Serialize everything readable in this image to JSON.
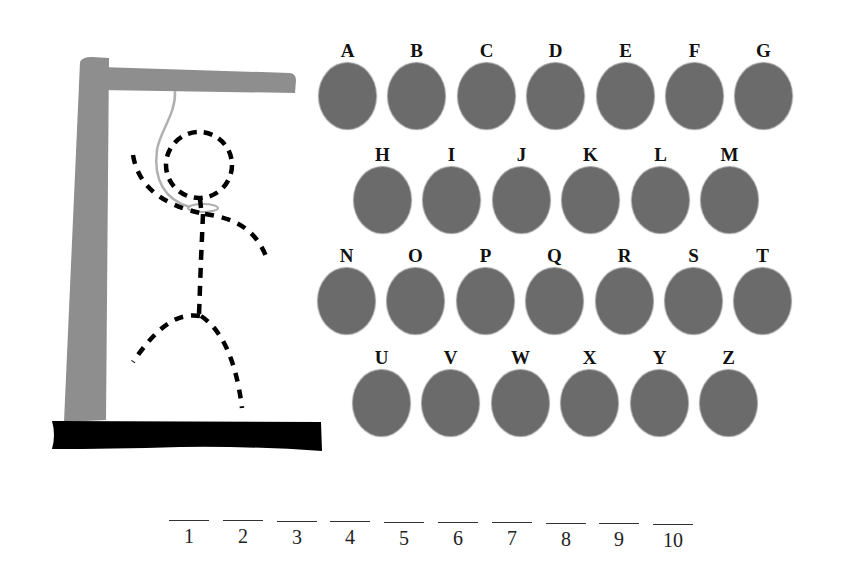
{
  "game": {
    "title": "Hangman",
    "colors": {
      "post": "#8e8e8e",
      "base": "#000000",
      "rope": "#b0b0b0",
      "figure": "#000000",
      "letter_disc": "#6b6b6b"
    }
  },
  "keyboard": {
    "rows": [
      {
        "left": 319,
        "top": 41,
        "letters": [
          "A",
          "B",
          "C",
          "D",
          "E",
          "F",
          "G"
        ]
      },
      {
        "left": 354,
        "top": 145,
        "letters": [
          "H",
          "I",
          "J",
          "K",
          "L",
          "M"
        ]
      },
      {
        "left": 318,
        "top": 246,
        "letters": [
          "N",
          "O",
          "P",
          "Q",
          "R",
          "S",
          "T"
        ]
      },
      {
        "left": 353,
        "top": 348,
        "letters": [
          "U",
          "V",
          "W",
          "X",
          "Y",
          "Z"
        ]
      }
    ],
    "pitch": 69.4
  },
  "word": {
    "slots": [
      {
        "number": "1",
        "letter": ""
      },
      {
        "number": "2",
        "letter": ""
      },
      {
        "number": "3",
        "letter": ""
      },
      {
        "number": "4",
        "letter": ""
      },
      {
        "number": "5",
        "letter": ""
      },
      {
        "number": "6",
        "letter": ""
      },
      {
        "number": "7",
        "letter": ""
      },
      {
        "number": "8",
        "letter": ""
      },
      {
        "number": "9",
        "letter": ""
      },
      {
        "number": "10",
        "letter": ""
      }
    ]
  }
}
